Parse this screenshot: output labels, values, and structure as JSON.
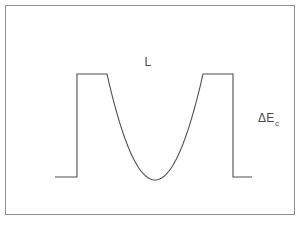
{
  "figure": {
    "background_color": "#ffffff",
    "frame": {
      "stroke_color": "#8d8d8d",
      "x": 5,
      "y": 5,
      "width": 290,
      "height": 210
    },
    "curve": {
      "stroke_color": "#4f4f4f",
      "description": "flat baseline, square barrier, parabolic well, square barrier, flat baseline"
    },
    "labels": {
      "well_width": {
        "text": "L",
        "x": 148,
        "y": 66
      },
      "band_offset": {
        "base": "ΔE",
        "subscript": "c",
        "x": 258,
        "y": 122
      }
    }
  },
  "chart_data": {
    "type": "line",
    "xlabel": "",
    "ylabel": "",
    "xlim": [
      55,
      252
    ],
    "ylim": [
      74,
      180
    ],
    "grid": false,
    "legend": null,
    "annotations": [
      {
        "text": "L",
        "meaning": "well width",
        "x": 148,
        "y": 66
      },
      {
        "text": "ΔE_c",
        "meaning": "conduction band offset",
        "x": 258,
        "y": 122
      }
    ],
    "segments": [
      {
        "name": "left-baseline",
        "kind": "horizontal",
        "x": [
          55,
          77
        ],
        "y": 177
      },
      {
        "name": "left-barrier-rise",
        "kind": "vertical",
        "x": 77,
        "y": [
          177,
          74
        ]
      },
      {
        "name": "left-barrier-top",
        "kind": "horizontal",
        "x": [
          77,
          107
        ],
        "y": 74
      },
      {
        "name": "parabolic-well",
        "kind": "parabola",
        "x": [
          107,
          203
        ],
        "y_edge": 74,
        "y_min": 180,
        "x_vertex": 155
      },
      {
        "name": "right-barrier-top",
        "kind": "horizontal",
        "x": [
          203,
          233
        ],
        "y": 74
      },
      {
        "name": "right-barrier-fall",
        "kind": "vertical",
        "x": 233,
        "y": [
          74,
          177
        ]
      },
      {
        "name": "right-baseline",
        "kind": "horizontal",
        "x": [
          233,
          252
        ],
        "y": 177
      }
    ],
    "points": [
      {
        "x": 55,
        "y": 177
      },
      {
        "x": 77,
        "y": 177
      },
      {
        "x": 77,
        "y": 74
      },
      {
        "x": 107,
        "y": 74
      },
      {
        "x": 113,
        "y": 88
      },
      {
        "x": 119,
        "y": 101
      },
      {
        "x": 125,
        "y": 113
      },
      {
        "x": 131,
        "y": 127
      },
      {
        "x": 137,
        "y": 142
      },
      {
        "x": 143,
        "y": 157
      },
      {
        "x": 149,
        "y": 172
      },
      {
        "x": 155,
        "y": 180
      },
      {
        "x": 161,
        "y": 178
      },
      {
        "x": 167,
        "y": 166
      },
      {
        "x": 173,
        "y": 150
      },
      {
        "x": 179,
        "y": 133
      },
      {
        "x": 185,
        "y": 117
      },
      {
        "x": 191,
        "y": 101
      },
      {
        "x": 197,
        "y": 87
      },
      {
        "x": 203,
        "y": 74
      },
      {
        "x": 233,
        "y": 74
      },
      {
        "x": 233,
        "y": 177
      },
      {
        "x": 252,
        "y": 177
      }
    ]
  }
}
